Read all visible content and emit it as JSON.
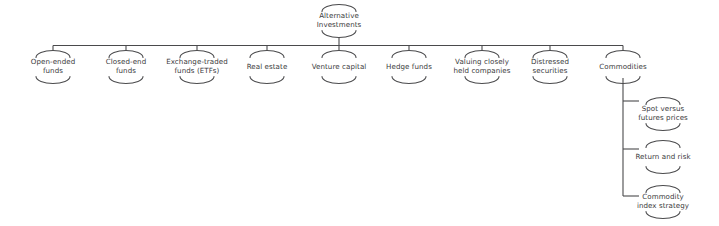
{
  "diagram": {
    "type": "hierarchy-tree",
    "title": "Alternative Investments",
    "style": {
      "line_color": "#4a4a4c",
      "text_color": "#3a3a3c",
      "background_color": "#ffffff",
      "line_width": 1.1
    },
    "root": {
      "id": "alternative-investments",
      "label": "Alternative\nInvestments",
      "cx": 339,
      "cy": 21
    },
    "trunk_y": 45.5,
    "trunk_x_start": 53,
    "trunk_x_end": 623,
    "children": [
      {
        "id": "open-ended-funds",
        "label": "Open-ended\nfunds",
        "cx": 53,
        "cy": 67
      },
      {
        "id": "closed-end-funds",
        "label": "Closed-end\nfunds",
        "cx": 126,
        "cy": 67
      },
      {
        "id": "exchange-traded-funds",
        "label": "Exchange-traded\nfunds (ETFs)",
        "cx": 197,
        "cy": 67
      },
      {
        "id": "real-estate",
        "label": "Real estate",
        "cx": 267,
        "cy": 67
      },
      {
        "id": "venture-capital",
        "label": "Venture capital",
        "cx": 339,
        "cy": 67
      },
      {
        "id": "hedge-funds",
        "label": "Hedge funds",
        "cx": 409,
        "cy": 67
      },
      {
        "id": "valuing-closely-held-companies",
        "label": "Valuing closely\nheld companies",
        "cx": 482,
        "cy": 67
      },
      {
        "id": "distressed-securities",
        "label": "Distressed\nsecurities",
        "cx": 550,
        "cy": 67
      },
      {
        "id": "commodities",
        "label": "Commodities",
        "cx": 623,
        "cy": 67
      }
    ],
    "sub_branch": {
      "parent_id": "commodities",
      "trunk_x": 623,
      "trunk_y_start": 78,
      "trunk_y_end": 196,
      "children": [
        {
          "id": "spot-versus-futures-prices",
          "label": "Spot versus\nfutures prices",
          "cx": 663,
          "cy": 114,
          "stub_y": 101
        },
        {
          "id": "return-and-risk",
          "label": "Return and risk",
          "cx": 663,
          "cy": 157,
          "stub_y": 149
        },
        {
          "id": "commodity-index-strategy",
          "label": "Commodity\nindex strategy",
          "cx": 663,
          "cy": 202,
          "stub_y": 196
        }
      ]
    }
  }
}
